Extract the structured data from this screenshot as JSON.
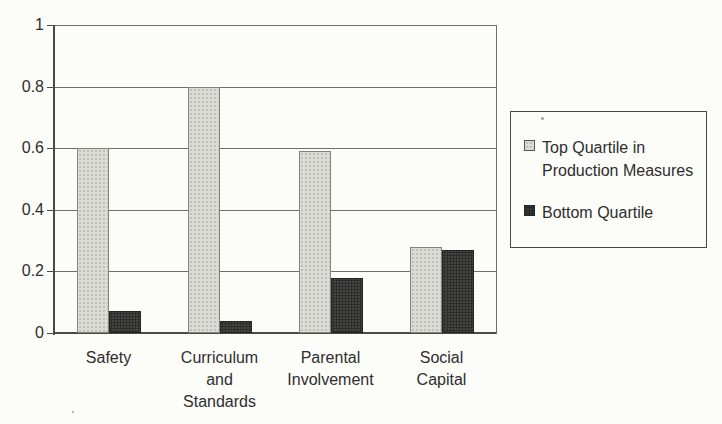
{
  "chart_data": {
    "type": "bar",
    "title": "",
    "xlabel": "",
    "ylabel": "",
    "categories": [
      "Safety",
      "Curriculum and Standards",
      "Parental Involvement",
      "Social Capital"
    ],
    "category_label_lines": [
      [
        "Safety"
      ],
      [
        "Curriculum",
        "and",
        "Standards"
      ],
      [
        "Parental",
        "Involvement"
      ],
      [
        "Social",
        "Capital"
      ]
    ],
    "series": [
      {
        "name": "Top Quartile in Production Measures",
        "color": "#dcdcd7",
        "values": [
          0.6,
          0.8,
          0.59,
          0.28
        ]
      },
      {
        "name": "Bottom Quartile",
        "color": "#454543",
        "values": [
          0.07,
          0.04,
          0.18,
          0.27
        ]
      }
    ],
    "ylim": [
      0,
      1
    ],
    "yticks": [
      0,
      0.2,
      0.4,
      0.6,
      0.8,
      1
    ],
    "ytick_labels": [
      "0",
      "0.2",
      "0.4",
      "0.6",
      "0.8",
      "1"
    ],
    "grid": "horizontal",
    "legend": {
      "position": "right",
      "entries": [
        {
          "label": "Top Quartile in Production Measures",
          "label_lines": [
            "Top Quartile in",
            "Production Measures"
          ]
        },
        {
          "label": "Bottom Quartile",
          "label_lines": [
            "Bottom Quartile"
          ]
        }
      ]
    }
  },
  "colors": {
    "background": "#fcfcf9",
    "gridline": "#6e6e6a",
    "axis": "#4a4a46",
    "text": "#2e2e2c"
  }
}
